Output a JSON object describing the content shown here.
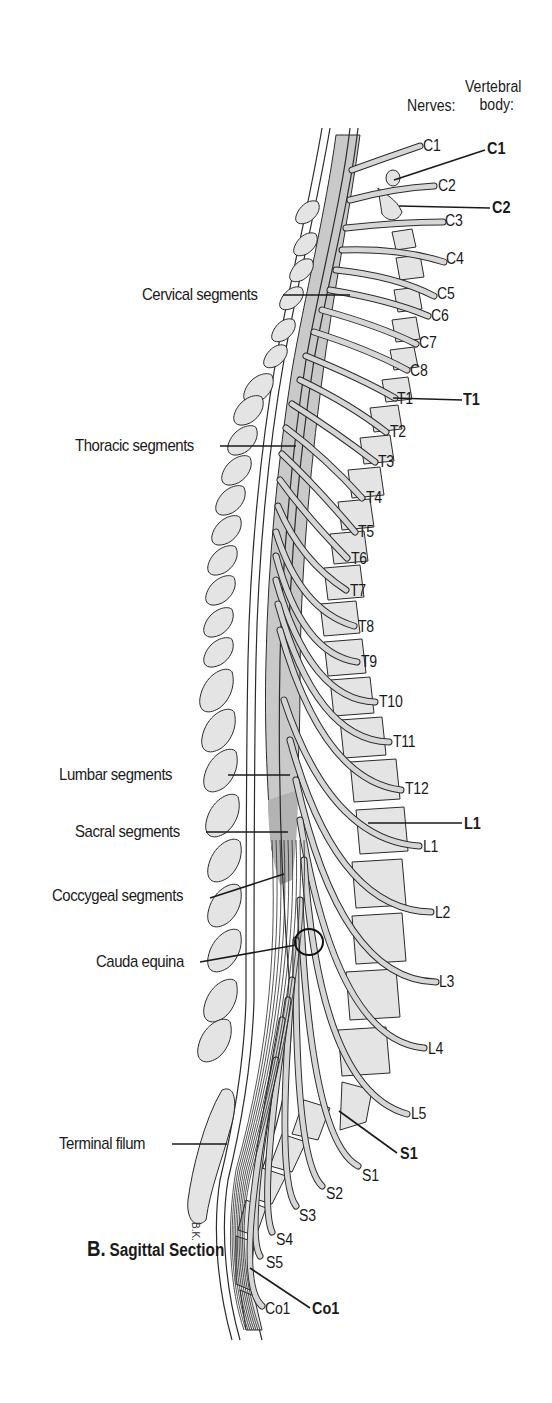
{
  "figure": {
    "caption_letter": "B.",
    "caption_text": "Sagittal Section",
    "signature": "B.K."
  },
  "headers": {
    "nerves": "Nerves:",
    "vertebral_body_line1": "Vertebral",
    "vertebral_body_line2": "body:"
  },
  "segment_labels": [
    {
      "text": "Cervical segments"
    },
    {
      "text": "Thoracic segments"
    },
    {
      "text": "Lumbar segments"
    },
    {
      "text": "Sacral segments"
    },
    {
      "text": "Coccygeal segments"
    },
    {
      "text": "Cauda equina"
    },
    {
      "text": "Terminal filum"
    }
  ],
  "nerve_labels": {
    "cervical": [
      "C1",
      "C2",
      "C3",
      "C4",
      "C5",
      "C6",
      "C7",
      "C8"
    ],
    "thoracic": [
      "T1",
      "T2",
      "T3",
      "T4",
      "T5",
      "T6",
      "T7",
      "T8",
      "T9",
      "T10",
      "T11",
      "T12"
    ],
    "lumbar": [
      "L1",
      "L2",
      "L3",
      "L4",
      "L5"
    ],
    "sacral": [
      "S1",
      "S2",
      "S3",
      "S4",
      "S5"
    ],
    "coccygeal": [
      "Co1"
    ]
  },
  "vertebral_body_labels": [
    "C1",
    "C2",
    "T1",
    "L1",
    "S1",
    "Co1"
  ],
  "colors": {
    "bone_fill": "#e4e4e4",
    "cord_fill": "#c9c9c9",
    "cord_dark": "#b3b3b3",
    "nerve_fill": "#d6d6d6",
    "outline": "#2b2b2b",
    "text": "#1a1a1a"
  }
}
